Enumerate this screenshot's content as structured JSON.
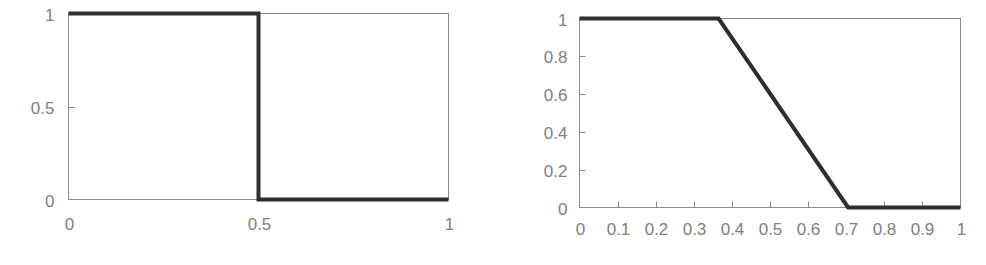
{
  "page": {
    "background_color": "#ffffff",
    "width": 986,
    "height": 265
  },
  "style": {
    "axis_color": "#8a8a8a",
    "line_color": "#2e2e2e",
    "label_color": "#808080"
  },
  "chart_data": [
    {
      "id": "left-chart",
      "name": "crisp-step-membership-function",
      "type": "line",
      "title": "",
      "subtitle": "",
      "xlabel": "",
      "ylabel": "",
      "xlim": [
        0,
        1
      ],
      "ylim": [
        0,
        1
      ],
      "grid": false,
      "legend": false,
      "legend_position": "none",
      "x_ticks": [
        0,
        0.5,
        1
      ],
      "x_tick_labels": [
        "0",
        "0.5",
        "1"
      ],
      "x_tick_marks_visible": false,
      "y_ticks": [
        0,
        0.5,
        1
      ],
      "y_tick_labels": [
        "0",
        "0.5",
        "1"
      ],
      "y_tick_marks_visible": true,
      "series": [
        {
          "name": "crisp set membership",
          "x": [
            0,
            0.5,
            0.5,
            1
          ],
          "y": [
            1,
            1,
            0,
            0
          ]
        }
      ],
      "annotations": []
    },
    {
      "id": "right-chart",
      "name": "fuzzy-trapezoidal-membership-function",
      "type": "line",
      "title": "",
      "subtitle": "",
      "xlabel": "",
      "ylabel": "",
      "xlim": [
        0,
        1
      ],
      "ylim": [
        0,
        1
      ],
      "grid": false,
      "legend": false,
      "legend_position": "none",
      "x_ticks": [
        0,
        0.1,
        0.2,
        0.3,
        0.4,
        0.5,
        0.6,
        0.7,
        0.8,
        0.9,
        1
      ],
      "x_tick_labels": [
        "0",
        "0.1",
        "0.2",
        "0.3",
        "0.4",
        "0.5",
        "0.6",
        "0.7",
        "0.8",
        "0.9",
        "1"
      ],
      "x_tick_marks_visible": true,
      "y_ticks": [
        0,
        0.2,
        0.4,
        0.6,
        0.8,
        1
      ],
      "y_tick_labels": [
        "0",
        "0.2",
        "0.4",
        "0.6",
        "0.8",
        "1"
      ],
      "y_tick_marks_visible": true,
      "series": [
        {
          "name": "fuzzy set membership",
          "x": [
            0,
            0.365,
            0.705,
            1
          ],
          "y": [
            1,
            1,
            0,
            0
          ]
        }
      ],
      "annotations": []
    }
  ]
}
